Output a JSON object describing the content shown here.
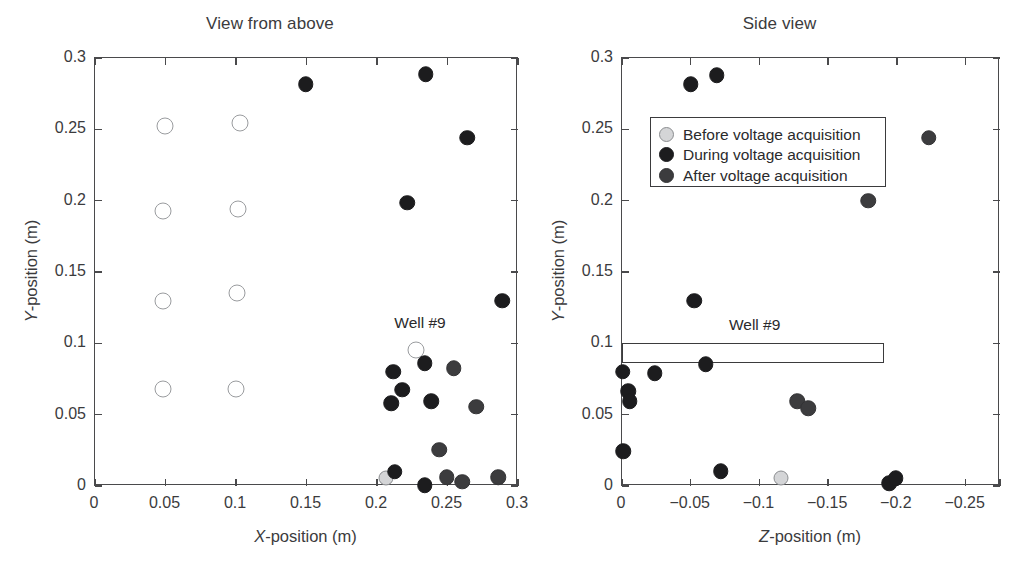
{
  "figure": {
    "background": "#ffffff",
    "colors": {
      "before": "#d4d5d7",
      "during": "#1c1c1e",
      "after": "#3c3c3e",
      "open_marker": "#ffffff",
      "axis": "#4a4a4c",
      "text": "#3b3b3d"
    }
  },
  "legend": {
    "position": "upper-left-of-right-panel",
    "entries": [
      {
        "label": "Before voltage acquisition",
        "style": "before"
      },
      {
        "label": "During voltage acquisition",
        "style": "during"
      },
      {
        "label": "After voltage acquisition",
        "style": "after"
      }
    ]
  },
  "chart_data": [
    {
      "type": "scatter",
      "title": "View from above",
      "xlabel": "X-position (m)",
      "ylabel": "Y-position (m)",
      "xlim": [
        0,
        0.3
      ],
      "ylim": [
        0,
        0.3
      ],
      "xticks": [
        0,
        0.05,
        0.1,
        0.15,
        0.2,
        0.25,
        0.3
      ],
      "xticklabels": [
        "0",
        "0.05",
        "0.1",
        "0.15",
        "0.2",
        "0.25",
        "0.3"
      ],
      "yticks": [
        0,
        0.05,
        0.1,
        0.15,
        0.2,
        0.25,
        0.3
      ],
      "yticklabels": [
        "0",
        "0.05",
        "0.1",
        "0.15",
        "0.2",
        "0.25",
        "0.3"
      ],
      "grid": false,
      "annotations": [
        {
          "text": "Well #9",
          "x": 0.2305,
          "y": 0.1135
        }
      ],
      "series": [
        {
          "name": "Well locations (open)",
          "style": "open",
          "points": [
            {
              "x": 0.0495,
              "y": 0.2525
            },
            {
              "x": 0.1025,
              "y": 0.2545
            },
            {
              "x": 0.0485,
              "y": 0.1925
            },
            {
              "x": 0.1015,
              "y": 0.1945
            },
            {
              "x": 0.048,
              "y": 0.13
            },
            {
              "x": 0.1005,
              "y": 0.1355
            },
            {
              "x": 0.0485,
              "y": 0.068
            },
            {
              "x": 0.1,
              "y": 0.068
            },
            {
              "x": 0.2275,
              "y": 0.0955
            }
          ]
        },
        {
          "name": "Before voltage acquisition",
          "style": "before",
          "points": [
            {
              "x": 0.2065,
              "y": 0.0055
            }
          ]
        },
        {
          "name": "During voltage acquisition",
          "style": "during",
          "points": [
            {
              "x": 0.1495,
              "y": 0.2815
            },
            {
              "x": 0.2345,
              "y": 0.2885
            },
            {
              "x": 0.264,
              "y": 0.244
            },
            {
              "x": 0.2215,
              "y": 0.1985
            },
            {
              "x": 0.289,
              "y": 0.13
            },
            {
              "x": 0.234,
              "y": 0.086
            },
            {
              "x": 0.2115,
              "y": 0.08
            },
            {
              "x": 0.218,
              "y": 0.0675
            },
            {
              "x": 0.21,
              "y": 0.058
            },
            {
              "x": 0.2385,
              "y": 0.0595
            },
            {
              "x": 0.2125,
              "y": 0.01
            },
            {
              "x": 0.234,
              "y": 0.0005
            }
          ]
        },
        {
          "name": "After voltage acquisition",
          "style": "after",
          "points": [
            {
              "x": 0.2545,
              "y": 0.0825
            },
            {
              "x": 0.2705,
              "y": 0.0555
            },
            {
              "x": 0.244,
              "y": 0.0255
            },
            {
              "x": 0.2495,
              "y": 0.006
            },
            {
              "x": 0.2605,
              "y": 0.003
            },
            {
              "x": 0.286,
              "y": 0.006
            }
          ]
        }
      ]
    },
    {
      "type": "scatter",
      "title": "Side view",
      "xlabel": "Z-position (m)",
      "ylabel": "Y-position (m)",
      "xlim": [
        0,
        -0.275
      ],
      "ylim": [
        0,
        0.3
      ],
      "xticks": [
        0,
        -0.05,
        -0.1,
        -0.15,
        -0.2,
        -0.25
      ],
      "xticklabels": [
        "0",
        "−0.05",
        "−0.1",
        "−0.15",
        "−0.2",
        "−0.25"
      ],
      "yticks": [
        0,
        0.05,
        0.1,
        0.15,
        0.2,
        0.25,
        0.3
      ],
      "yticklabels": [
        "0",
        "0.05",
        "0.1",
        "0.15",
        "0.2",
        "0.25",
        "0.3"
      ],
      "grid": false,
      "annotations": [
        {
          "text": "Well #9",
          "x": -0.0965,
          "y": 0.1125
        }
      ],
      "shapes": [
        {
          "type": "rect",
          "name": "well-9-outline",
          "x0": 0.0,
          "x1": -0.1905,
          "y0": 0.0865,
          "y1": 0.1005
        }
      ],
      "series": [
        {
          "name": "Before voltage acquisition",
          "style": "before",
          "points": [
            {
              "x": -0.1155,
              "y": 0.0055
            }
          ]
        },
        {
          "name": "During voltage acquisition",
          "style": "during",
          "points": [
            {
              "x": -0.05,
              "y": 0.2815
            },
            {
              "x": -0.069,
              "y": 0.288
            },
            {
              "x": -0.0525,
              "y": 0.13
            },
            {
              "x": -0.061,
              "y": 0.0855
            },
            {
              "x": -0.0005,
              "y": 0.08
            },
            {
              "x": -0.024,
              "y": 0.079
            },
            {
              "x": -0.0045,
              "y": 0.0665
            },
            {
              "x": -0.0055,
              "y": 0.0595
            },
            {
              "x": -0.001,
              "y": 0.0245
            },
            {
              "x": -0.072,
              "y": 0.0105
            },
            {
              "x": -0.1945,
              "y": 0.002
            },
            {
              "x": -0.199,
              "y": 0.0055
            }
          ]
        },
        {
          "name": "After voltage acquisition",
          "style": "after",
          "points": [
            {
              "x": -0.223,
              "y": 0.244
            },
            {
              "x": -0.179,
              "y": 0.2
            },
            {
              "x": -0.1275,
              "y": 0.0595
            },
            {
              "x": -0.1355,
              "y": 0.0545
            }
          ]
        }
      ]
    }
  ]
}
